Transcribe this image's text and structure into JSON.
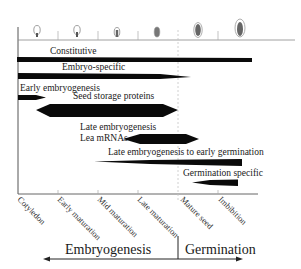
{
  "diagram": {
    "type": "gene-expression-timeline",
    "stages": [
      "Cotyledon",
      "Early maturation",
      "Mid maturation",
      "Late maturation",
      "Mature seed",
      "Imbibition"
    ],
    "expression_classes": [
      {
        "label": "Constitutive",
        "start_stage": "Cotyledon",
        "end_stage": "Imbibition",
        "shape": "bar"
      },
      {
        "label": "Embryo-specific",
        "start_stage": "Cotyledon",
        "end_stage": "Mature seed",
        "shape": "tapered-right"
      },
      {
        "label": "Early embryogenesis",
        "start_stage": "Cotyledon",
        "end_stage": "Early maturation",
        "shape": "arrow-right"
      },
      {
        "label": "Seed storage proteins",
        "start_stage": "Early maturation",
        "end_stage": "Mature seed",
        "shape": "hexagon"
      },
      {
        "label_line1": "Late embryogenesis",
        "label_line2": "Lea mRNAs",
        "start_stage": "Late maturation",
        "end_stage": "Mature seed",
        "shape": "hexagon"
      },
      {
        "label": "Late embryogenesis  to early germination",
        "start_stage": "Mid maturation",
        "end_stage": "Imbibition",
        "shape": "tapered-left"
      },
      {
        "label": "Germination specific",
        "start_stage": "Mature seed",
        "end_stage": "Imbibition",
        "shape": "tapered-left"
      }
    ],
    "phases": {
      "left": "Embryogenesis",
      "right": "Germination"
    },
    "colors": {
      "bar": "#0a0a0a",
      "axis": "#555555",
      "divider": "#bbbbbb",
      "seed_outline": "#777777",
      "seed_fill": "#555555"
    }
  }
}
